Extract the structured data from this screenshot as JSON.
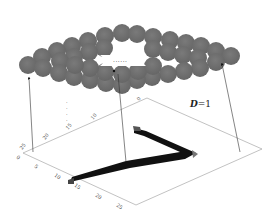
{
  "diagram": {
    "label": "D=1",
    "label_var": "D",
    "label_eq": "=1",
    "ellipsis_hole": "......",
    "ellipsis_vertical": "⋮",
    "x_axis_ticks": [
      "0",
      "5",
      "10",
      "15",
      "20",
      "25"
    ],
    "y_axis_ticks": [
      "25",
      "20",
      "15",
      "10",
      "0"
    ],
    "colors": {
      "sphere": "#6e6e6e",
      "sphere_edge": "#5a5a5a",
      "stroke": "#000000",
      "axis": "#888888",
      "arrow": "#222222",
      "background": "#ffffff"
    },
    "components": [
      "sphere-lattice",
      "plane-with-digit",
      "projection-arrows"
    ]
  }
}
